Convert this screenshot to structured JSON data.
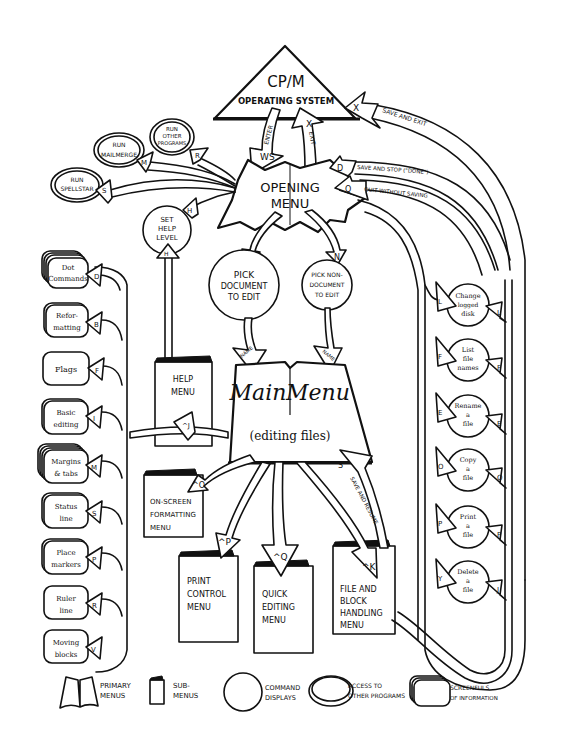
{
  "diagram": {
    "root": {
      "label_top": "CP/M",
      "label_bottom": "OPERATING SYSTEM"
    },
    "opening_menu": {
      "line1": "OPENING",
      "line2": "MENU"
    },
    "enter_arrow": {
      "key": "WS",
      "label": "ENTER"
    },
    "exit_arrow": {
      "key": "X",
      "label": "EXIT"
    },
    "return_arrows": [
      {
        "key": "X",
        "label": "SAVE AND EXIT"
      },
      {
        "key": "D",
        "label": "SAVE AND STOP (\"DONE\")"
      },
      {
        "key": "Q",
        "label": "QUIT WITHOUT SAVING"
      }
    ],
    "other_programs": [
      {
        "key": "S",
        "lines": [
          "RUN",
          "SPELLSTAR"
        ]
      },
      {
        "key": "M",
        "lines": [
          "RUN",
          "MAILMERGE"
        ]
      },
      {
        "key": "R",
        "lines": [
          "RUN",
          "OTHER",
          "PROGRAMS"
        ]
      }
    ],
    "help_level": {
      "key": "H",
      "lines": [
        "SET",
        "HELP",
        "LEVEL"
      ]
    },
    "pick_document": {
      "key": "D",
      "lines": [
        "PICK",
        "DOCUMENT",
        "TO EDIT"
      ],
      "arrow_label": "NAME"
    },
    "pick_nondocument": {
      "key": "N",
      "lines": [
        "PICK NON-",
        "DOCUMENT",
        "TO EDIT"
      ],
      "arrow_label": "NAME"
    },
    "main_menu": {
      "left": "Main",
      "right": "Menu",
      "subtitle": "(editing files)"
    },
    "help_menu": {
      "key": "^J",
      "lines": [
        "HELP",
        "MENU"
      ],
      "up_key": "H"
    },
    "submenus": [
      {
        "key": "^O",
        "lines": [
          "ON-SCREEN",
          "FORMATTING",
          "MENU"
        ]
      },
      {
        "key": "^P",
        "lines": [
          "PRINT",
          "CONTROL",
          "MENU"
        ]
      },
      {
        "key": "^Q",
        "lines": [
          "QUICK",
          "EDITING",
          "MENU"
        ]
      },
      {
        "key": "^K",
        "lines": [
          "FILE AND",
          "BLOCK",
          "HANDLING",
          "MENU"
        ]
      }
    ],
    "save_resume": {
      "key": "S",
      "label": "SAVE AND RESUME"
    },
    "help_screens": [
      {
        "key": "D",
        "lines": [
          "Dot",
          "Commands"
        ]
      },
      {
        "key": "B",
        "lines": [
          "Refor-",
          "matting"
        ]
      },
      {
        "key": "F",
        "lines": [
          "Flags"
        ]
      },
      {
        "key": "I",
        "lines": [
          "Basic",
          "editing"
        ]
      },
      {
        "key": "M",
        "lines": [
          "Margins",
          "& tabs"
        ]
      },
      {
        "key": "S",
        "lines": [
          "Status",
          "line"
        ]
      },
      {
        "key": "P",
        "lines": [
          "Place",
          "markers"
        ]
      },
      {
        "key": "R",
        "lines": [
          "Ruler",
          "line"
        ]
      },
      {
        "key": "V",
        "lines": [
          "Moving",
          "blocks"
        ]
      }
    ],
    "file_commands": [
      {
        "key_in": "L",
        "key_out": "L",
        "lines": [
          "Change",
          "logged",
          "disk"
        ]
      },
      {
        "key_in": "F",
        "key_out": "F",
        "lines": [
          "List",
          "file",
          "names"
        ]
      },
      {
        "key_in": "E",
        "key_out": "E",
        "lines": [
          "Rename",
          "a",
          "file"
        ]
      },
      {
        "key_in": "O",
        "key_out": "O",
        "lines": [
          "Copy",
          "a",
          "file"
        ]
      },
      {
        "key_in": "P",
        "key_out": "P",
        "lines": [
          "Print",
          "a",
          "file"
        ]
      },
      {
        "key_in": "Y",
        "key_out": "J",
        "lines": [
          "Delete",
          "a",
          "file"
        ]
      }
    ],
    "legend": [
      {
        "icon": "open-book-icon",
        "lines": [
          "PRIMARY",
          "MENUS"
        ]
      },
      {
        "icon": "folded-page-icon",
        "lines": [
          "SUB-",
          "MENUS"
        ]
      },
      {
        "icon": "circle-icon",
        "lines": [
          "COMMAND",
          "DISPLAYS"
        ]
      },
      {
        "icon": "double-ellipse-icon",
        "lines": [
          "ACCESS TO",
          "OTHER PROGRAMS"
        ]
      },
      {
        "icon": "stacked-screen-icon",
        "lines": [
          "SCREENFULS",
          "OF INFORMATION"
        ]
      }
    ]
  }
}
